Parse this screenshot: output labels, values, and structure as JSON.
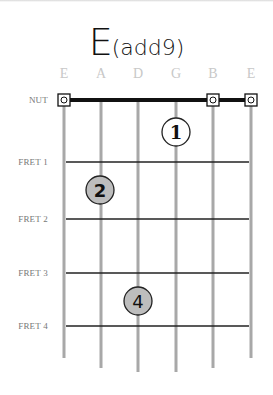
{
  "chord": {
    "root": "E",
    "extension": "(add9)"
  },
  "strings": [
    "E",
    "A",
    "D",
    "G",
    "B",
    "E"
  ],
  "fret_labels": [
    "NUT",
    "FRET 1",
    "FRET 2",
    "FRET 3",
    "FRET 4"
  ],
  "open_strings": [
    0,
    4,
    5
  ],
  "fingers": [
    {
      "finger": "1",
      "string": 3,
      "fret": 1,
      "style": "open"
    },
    {
      "finger": "2",
      "string": 1,
      "fret": 2,
      "style": "filled"
    },
    {
      "finger": "4",
      "string": 2,
      "fret": 4,
      "style": "filled"
    }
  ],
  "colors": {
    "string": "#a8a8a8",
    "fret": "#222222",
    "finger_fill": "#bdbdbd",
    "label": "#777777",
    "string_name": "#c8c8c8"
  }
}
